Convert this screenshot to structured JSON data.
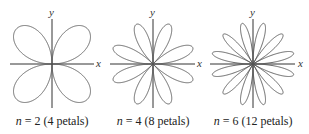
{
  "figure": {
    "panels": [
      {
        "n": 2,
        "petals": 4,
        "x_label": "x",
        "y_label": "y",
        "caption_var": "n",
        "caption_rest": " = 2 (4 petals)"
      },
      {
        "n": 4,
        "petals": 8,
        "x_label": "x",
        "y_label": "y",
        "caption_var": "n",
        "caption_rest": " = 4 (8 petals)"
      },
      {
        "n": 6,
        "petals": 12,
        "x_label": "x",
        "y_label": "y",
        "caption_var": "n",
        "caption_rest": " = 6 (12 petals)"
      }
    ],
    "colors": {
      "axis": "#333333",
      "curve": "#555555",
      "text": "#222222"
    }
  }
}
